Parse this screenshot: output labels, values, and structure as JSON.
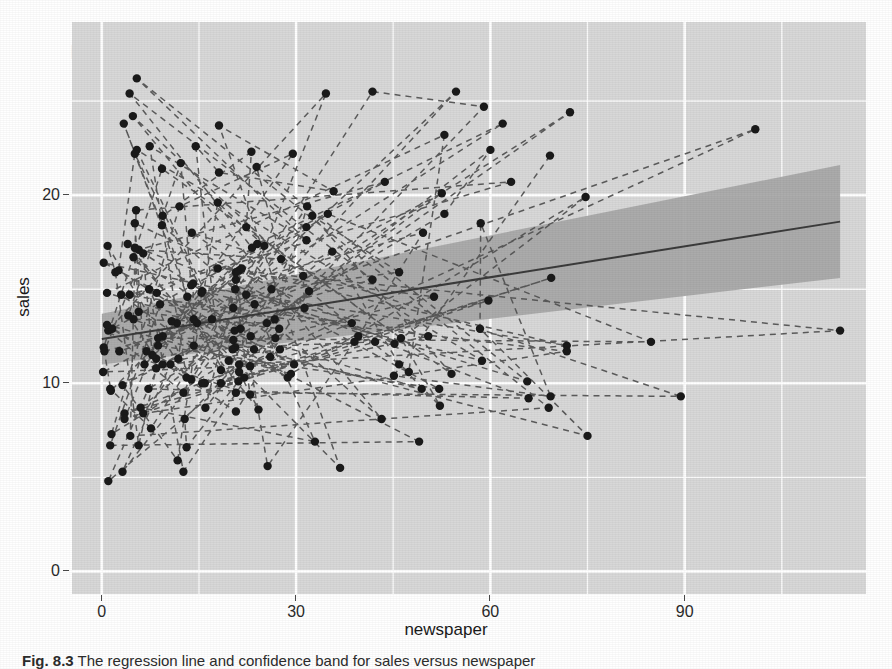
{
  "figure": {
    "caption_label": "Fig. 8.3",
    "caption_text": "The regression line and confidence band for sales versus newspaper"
  },
  "ghost_text": [
    {
      "text": "Ε Υ ο ν τ α ο ς  γρ ει ας  δι  εαο υνα  ειδ ιημ  οσταιδ",
      "x": 70,
      "y": 40,
      "size": 21
    },
    {
      "text": "ται",
      "x": 720,
      "y": 66,
      "size": 21
    },
    {
      "text": "ευσ τη αι α",
      "x": 380,
      "y": 520,
      "size": 20
    }
  ],
  "chart_data": {
    "type": "scatter",
    "title": "",
    "xlabel": "newspaper",
    "ylabel": "sales",
    "xlim": [
      -4.6,
      118.0
    ],
    "ylim": [
      -1.2,
      29.2
    ],
    "xticks": [
      0,
      30,
      60,
      90
    ],
    "yticks": [
      0,
      10,
      20
    ],
    "x_minor_ticks": [
      15,
      45,
      75,
      105
    ],
    "y_minor_ticks": [
      5,
      15,
      25
    ],
    "grid": true,
    "grid_color": "#ffffff",
    "panel_color": "#d8d8d8",
    "legend": "none",
    "point_color": "#1a1a1a",
    "point_size": 4.2,
    "fit_line_color": "#3b3b3b",
    "fit_line_width": 2.0,
    "ribbon_color": "#a9a9a9",
    "path_line_color": "#545454",
    "path_line_style": "dashed",
    "series": [
      {
        "name": "observations",
        "description": "sales (thousands of units) against newspaper advertising budget (thousands of dollars)",
        "points": [
          [
            69.2,
            22.1
          ],
          [
            45.1,
            10.4
          ],
          [
            69.3,
            9.3
          ],
          [
            58.5,
            18.5
          ],
          [
            58.4,
            12.9
          ],
          [
            75.0,
            7.2
          ],
          [
            23.5,
            11.8
          ],
          [
            11.6,
            13.2
          ],
          [
            1.0,
            4.8
          ],
          [
            21.2,
            10.6
          ],
          [
            24.2,
            8.6
          ],
          [
            4.0,
            17.4
          ],
          [
            65.9,
            9.2
          ],
          [
            7.2,
            9.7
          ],
          [
            52.9,
            19.0
          ],
          [
            60.0,
            22.4
          ],
          [
            23.0,
            12.5
          ],
          [
            72.3,
            24.4
          ],
          [
            11.8,
            11.3
          ],
          [
            13.2,
            14.6
          ],
          [
            49.6,
            18.0
          ],
          [
            39.6,
            12.5
          ],
          [
            25.6,
            5.6
          ],
          [
            20.7,
            15.5
          ],
          [
            52.1,
            9.7
          ],
          [
            8.7,
            12.0
          ],
          [
            26.2,
            15.0
          ],
          [
            45.9,
            15.9
          ],
          [
            32.5,
            18.9
          ],
          [
            54.0,
            10.5
          ],
          [
            9.3,
            21.4
          ],
          [
            0.3,
            11.9
          ],
          [
            1.4,
            9.6
          ],
          [
            24.0,
            17.4
          ],
          [
            12.6,
            9.5
          ],
          [
            1.0,
            12.8
          ],
          [
            34.6,
            25.4
          ],
          [
            22.3,
            14.7
          ],
          [
            65.7,
            10.1
          ],
          [
            23.9,
            21.5
          ],
          [
            27.7,
            16.6
          ],
          [
            5.7,
            17.1
          ],
          [
            43.7,
            20.7
          ],
          [
            1.6,
            12.9
          ],
          [
            20.7,
            8.5
          ],
          [
            32.0,
            14.9
          ],
          [
            47.4,
            10.6
          ],
          [
            52.9,
            23.2
          ],
          [
            0.8,
            14.8
          ],
          [
            49.4,
            9.7
          ],
          [
            26.0,
            11.4
          ],
          [
            18.4,
            10.7
          ],
          [
            14.5,
            22.6
          ],
          [
            18.1,
            21.2
          ],
          [
            35.8,
            20.2
          ],
          [
            18.1,
            23.7
          ],
          [
            36.8,
            5.5
          ],
          [
            14.7,
            13.2
          ],
          [
            3.4,
            23.8
          ],
          [
            9.3,
            18.4
          ],
          [
            43.2,
            8.1
          ],
          [
            4.8,
            24.2
          ],
          [
            31.1,
            15.7
          ],
          [
            31.3,
            14.0
          ],
          [
            13.9,
            18.0
          ],
          [
            89.4,
            9.3
          ],
          [
            20.7,
            9.5
          ],
          [
            14.2,
            13.4
          ],
          [
            9.4,
            18.9
          ],
          [
            23.1,
            22.3
          ],
          [
            22.3,
            18.3
          ],
          [
            46.2,
            12.4
          ],
          [
            52.2,
            8.8
          ],
          [
            45.9,
            11.0
          ],
          [
            35.6,
            17.0
          ],
          [
            6.0,
            8.7
          ],
          [
            32.9,
            6.9
          ],
          [
            23.6,
            14.2
          ],
          [
            3.2,
            5.3
          ],
          [
            10.6,
            11.0
          ],
          [
            27.5,
            11.8
          ],
          [
            20.3,
            12.3
          ],
          [
            8.4,
            11.3
          ],
          [
            4.1,
            13.6
          ],
          [
            12.2,
            21.7
          ],
          [
            13.8,
            15.2
          ],
          [
            71.8,
            12.0
          ],
          [
            21.2,
            16.0
          ],
          [
            21.4,
            12.9
          ],
          [
            4.9,
            16.7
          ],
          [
            19.6,
            11.2
          ],
          [
            1.5,
            7.3
          ],
          [
            12.0,
            19.4
          ],
          [
            29.5,
            22.2
          ],
          [
            7.8,
            11.5
          ],
          [
            6.4,
            16.9
          ],
          [
            0.4,
            11.7
          ],
          [
            41.8,
            15.5
          ],
          [
            4.3,
            25.4
          ],
          [
            23.2,
            17.2
          ],
          [
            6.9,
            11.7
          ],
          [
            61.9,
            23.8
          ],
          [
            8.5,
            14.8
          ],
          [
            4.3,
            14.7
          ],
          [
            63.2,
            20.7
          ],
          [
            5.3,
            19.2
          ],
          [
            4.4,
            7.2
          ],
          [
            69.0,
            8.7
          ],
          [
            5.4,
            26.2
          ],
          [
            31.6,
            17.6
          ],
          [
            7.4,
            22.6
          ],
          [
            13.1,
            10.3
          ],
          [
            0.9,
            17.3
          ],
          [
            2.1,
            15.9
          ],
          [
            5.7,
            6.7
          ],
          [
            8.4,
            10.8
          ],
          [
            3.2,
            9.9
          ],
          [
            11.7,
            5.9
          ],
          [
            17.9,
            19.6
          ],
          [
            25.1,
            17.3
          ],
          [
            7.6,
            7.6
          ],
          [
            1.3,
            9.7
          ],
          [
            20.5,
            12.8
          ],
          [
            54.7,
            25.5
          ],
          [
            17.0,
            13.4
          ],
          [
            6.4,
            8.4
          ],
          [
            71.8,
            11.7
          ],
          [
            9.0,
            14.2
          ],
          [
            1.3,
            6.7
          ],
          [
            49.0,
            6.9
          ],
          [
            20.6,
            11.9
          ],
          [
            42.2,
            12.2
          ],
          [
            3.5,
            8.4
          ],
          [
            38.6,
            13.2
          ],
          [
            3.0,
            14.7
          ],
          [
            21.1,
            10.1
          ],
          [
            13.1,
            6.6
          ],
          [
            12.8,
            8.1
          ],
          [
            59.0,
            24.7
          ],
          [
            41.8,
            25.5
          ],
          [
            20.3,
            14.0
          ],
          [
            14.1,
            15.3
          ],
          [
            14.2,
            12.0
          ],
          [
            9.4,
            11.0
          ],
          [
            51.3,
            14.6
          ],
          [
            20.7,
            15.9
          ],
          [
            9.4,
            12.5
          ],
          [
            15.5,
            14.9
          ],
          [
            58.7,
            11.2
          ],
          [
            5.4,
            22.4
          ],
          [
            20.2,
            11.8
          ],
          [
            15.4,
            14.8
          ],
          [
            31.6,
            18.3
          ],
          [
            18.4,
            10.0
          ],
          [
            69.4,
            15.6
          ],
          [
            39.0,
            12.2
          ],
          [
            22.0,
            10.3
          ],
          [
            5.1,
            22.2
          ],
          [
            2.6,
            16.0
          ],
          [
            28.7,
            10.3
          ],
          [
            10.8,
            13.3
          ],
          [
            34.9,
            19.0
          ],
          [
            84.8,
            12.2
          ],
          [
            8.7,
            12.4
          ],
          [
            3.5,
            8.1
          ],
          [
            59.7,
            14.4
          ],
          [
            22.9,
            10.9
          ],
          [
            4.9,
            13.4
          ],
          [
            25.5,
            13.2
          ],
          [
            52.5,
            20.1
          ],
          [
            0.2,
            10.6
          ],
          [
            29.7,
            11.0
          ],
          [
            0.3,
            16.4
          ],
          [
            50.4,
            12.5
          ],
          [
            15.9,
            10.0
          ],
          [
            100.9,
            23.5
          ],
          [
            2.7,
            11.7
          ],
          [
            22.9,
            9.4
          ],
          [
            20.6,
            15.0
          ],
          [
            16.0,
            8.7
          ],
          [
            26.7,
            13.4
          ],
          [
            31.7,
            19.4
          ],
          [
            13.8,
            10.2
          ],
          [
            7.3,
            15.0
          ],
          [
            12.6,
            5.3
          ],
          [
            27.4,
            12.9
          ],
          [
            5.7,
            13.8
          ],
          [
            5.1,
            17.2
          ],
          [
            26.8,
            12.4
          ],
          [
            21.2,
            11.0
          ],
          [
            114.0,
            12.8
          ],
          [
            17.9,
            16.1
          ],
          [
            21.6,
            16.1
          ],
          [
            6.6,
            11.0
          ],
          [
            5.1,
            18.5
          ],
          [
            45.2,
            12.1
          ],
          [
            74.7,
            19.9
          ],
          [
            29.2,
            10.5
          ],
          [
            0.8,
            13.1
          ],
          [
            15.5,
            10.0
          ]
        ]
      }
    ],
    "fit": {
      "name": "linear regression (lm)",
      "formula": "sales ~ newspaper",
      "intercept": 12.35,
      "slope": 0.0547,
      "x_start": 0.0,
      "x_end": 114.0,
      "y_start": 12.35,
      "y_end": 18.59,
      "ci_level": 0.95,
      "ci_lower_start": 11.0,
      "ci_upper_start": 13.7,
      "ci_lower_end": 15.6,
      "ci_upper_end": 21.6
    }
  }
}
